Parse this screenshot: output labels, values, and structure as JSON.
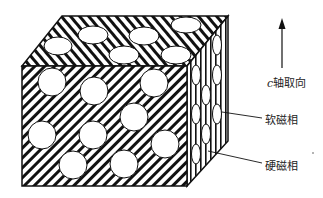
{
  "diagram": {
    "type": "schematic",
    "labels": {
      "c_axis_prefix": "c",
      "c_axis": "轴取向",
      "soft_phase": "软磁相",
      "hard_phase": "硬磁相"
    },
    "colors": {
      "line": "#111111",
      "background": "#ffffff"
    }
  }
}
